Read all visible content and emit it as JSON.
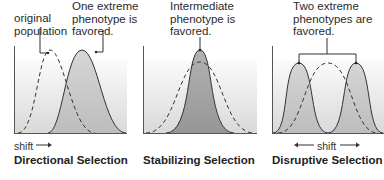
{
  "panels": [
    {
      "id": "directional",
      "title": "Directional Selection",
      "annotations": [
        {
          "text_lines": [
            "original",
            "population"
          ],
          "points_to": "dashed-curve-peak"
        },
        {
          "text_lines": [
            "One extreme",
            "phenotype is",
            "favored."
          ],
          "points_to": "solid-curve-peak"
        }
      ],
      "shift_label": "shift",
      "shift_direction": "right"
    },
    {
      "id": "stabilizing",
      "title": "Stabilizing Selection",
      "annotations": [
        {
          "text_lines": [
            "Intermediate",
            "phenotype is",
            "favored."
          ],
          "points_to": "solid-curve-peak"
        }
      ]
    },
    {
      "id": "disruptive",
      "title": "Disruptive Selection",
      "annotations": [
        {
          "text_lines": [
            "Two extreme",
            "phenotypes are",
            "favored."
          ],
          "points_to": "both-solid-curve-peaks"
        }
      ],
      "shift_label": "shift",
      "shift_direction": "both"
    }
  ],
  "colors": {
    "curve_stroke": "#333333",
    "panel_bg_light": "#f4f4f4",
    "panel_bg_dark": "#d4d4d4",
    "favored_fill": "#bdbdbd"
  }
}
